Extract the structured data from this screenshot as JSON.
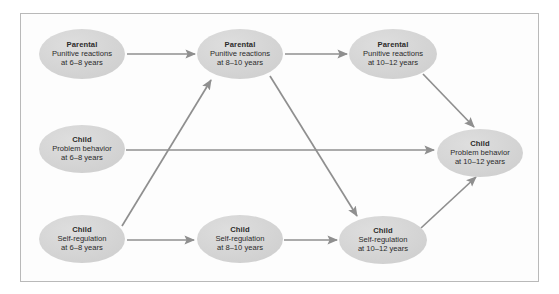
{
  "figure": {
    "frame_border_color": "#b9b9b9",
    "background_color": "#ffffff",
    "node_fill_color": "#d4d4d4",
    "arrow_color": "#8f8f8f",
    "text_color": "#2b2b2b"
  },
  "nodes": [
    {
      "id": "parental-punitive-6-8",
      "title": "Parental",
      "line2": "Punitive reactions",
      "line3": "at 6–8 years",
      "cx": 82,
      "cy": 54,
      "rx": 43,
      "ry": 25
    },
    {
      "id": "parental-punitive-8-10",
      "title": "Parental",
      "line2": "Punitive reactions",
      "line3": "at 8–10 years",
      "cx": 240,
      "cy": 54,
      "rx": 43,
      "ry": 25
    },
    {
      "id": "parental-punitive-10-12",
      "title": "Parental",
      "line2": "Punitive reactions",
      "line3": "at 10–12 years",
      "cx": 393,
      "cy": 54,
      "rx": 44,
      "ry": 25
    },
    {
      "id": "child-problem-6-8",
      "title": "Child",
      "line2": "Problem behavior",
      "line3": "at 6–8 years",
      "cx": 82,
      "cy": 149,
      "rx": 43,
      "ry": 24
    },
    {
      "id": "child-problem-10-12",
      "title": "Child",
      "line2": "Problem behavior",
      "line3": "at 10–12 years",
      "cx": 480,
      "cy": 153,
      "rx": 43,
      "ry": 24
    },
    {
      "id": "child-selfreg-6-8",
      "title": "Child",
      "line2": "Self-regulation",
      "line3": "at 6–8 years",
      "cx": 82,
      "cy": 239,
      "rx": 43,
      "ry": 24
    },
    {
      "id": "child-selfreg-8-10",
      "title": "Child",
      "line2": "Self-regulation",
      "line3": "at 8–10 years",
      "cx": 240,
      "cy": 239,
      "rx": 43,
      "ry": 24
    },
    {
      "id": "child-selfreg-10-12",
      "title": "Child",
      "line2": "Self-regulation",
      "line3": "at 10–12 years",
      "cx": 383,
      "cy": 240,
      "rx": 44,
      "ry": 24
    }
  ],
  "arrows": [
    {
      "id": "arrow-parental68-to-parental810",
      "from": "parental-punitive-6-8",
      "to": "parental-punitive-8-10",
      "x1": 127,
      "y1": 54,
      "x2": 195,
      "y2": 54
    },
    {
      "id": "arrow-parental810-to-parental1012",
      "from": "parental-punitive-8-10",
      "to": "parental-punitive-10-12",
      "x1": 285,
      "y1": 54,
      "x2": 347,
      "y2": 54
    },
    {
      "id": "arrow-selfreg68-to-parental810",
      "from": "child-selfreg-6-8",
      "to": "parental-punitive-8-10",
      "x1": 122,
      "y1": 226,
      "x2": 211,
      "y2": 80
    },
    {
      "id": "arrow-parental810-to-selfreg1012",
      "from": "parental-punitive-8-10",
      "to": "child-selfreg-10-12",
      "x1": 270,
      "y1": 76,
      "x2": 357,
      "y2": 216
    },
    {
      "id": "arrow-parental1012-to-problem1012",
      "from": "parental-punitive-10-12",
      "to": "child-problem-10-12",
      "x1": 423,
      "y1": 74,
      "x2": 474,
      "y2": 127
    },
    {
      "id": "arrow-problem68-to-problem1012",
      "from": "child-problem-6-8",
      "to": "child-problem-10-12",
      "x1": 126,
      "y1": 150,
      "x2": 434,
      "y2": 150
    },
    {
      "id": "arrow-selfreg68-to-selfreg810",
      "from": "child-selfreg-6-8",
      "to": "child-selfreg-8-10",
      "x1": 127,
      "y1": 240,
      "x2": 194,
      "y2": 240
    },
    {
      "id": "arrow-selfreg810-to-selfreg1012",
      "from": "child-selfreg-8-10",
      "to": "child-selfreg-10-12",
      "x1": 284,
      "y1": 240,
      "x2": 337,
      "y2": 240
    },
    {
      "id": "arrow-selfreg1012-to-problem1012",
      "from": "child-selfreg-10-12",
      "to": "child-problem-10-12",
      "x1": 421,
      "y1": 228,
      "x2": 476,
      "y2": 177
    }
  ]
}
